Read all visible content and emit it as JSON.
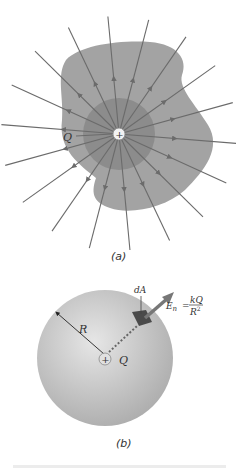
{
  "figure_a": {
    "caption": "(a)",
    "charge_label": "Q",
    "charge_sign": "+",
    "field_line_count": 18,
    "colors": {
      "outer_surface": "#a3a3a3",
      "inner_sphere": "#8c8c8c",
      "field_lines": "#6b6b6b",
      "charge_fill": "#f2f2f2"
    }
  },
  "figure_b": {
    "caption": "(b)",
    "radius_label": "R",
    "charge_label": "Q",
    "charge_sign": "+",
    "area_label": "dA",
    "field_label": "E",
    "field_subscript": "n",
    "equals": "=",
    "numerator": "kQ",
    "denominator": "R",
    "exponent": "2",
    "colors": {
      "sphere_light": "#e6e6e6",
      "sphere_dark": "#a9a9a9",
      "area_patch": "#4a4a4a",
      "arrow": "#777777"
    }
  }
}
